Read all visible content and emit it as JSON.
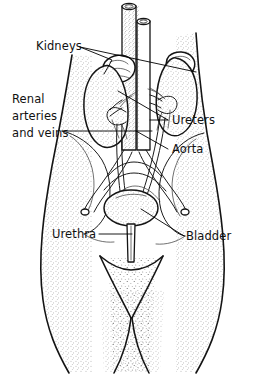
{
  "diagram": {
    "view": "posterior trunk and pelvis",
    "background_color": "#ffffff",
    "ink_color": "#141414",
    "style": "black and white stippled line drawing",
    "width": 264,
    "height": 385,
    "labels": [
      {
        "id": "kidneys",
        "text": "Kidneys",
        "x": 36,
        "y": 50,
        "anchor": "start",
        "side": "left",
        "leaders": [
          "M 93 46 L 112 60 L 104 74",
          "M 93 46 L 196 72"
        ]
      },
      {
        "id": "renal-arteries-and-veins",
        "text": "Renal\narteries\nand veins",
        "line1": "Renal",
        "line2": "arteries",
        "line3": "and veins",
        "x": 12,
        "y": 103,
        "anchor": "start",
        "side": "left",
        "leaders": [
          "M 62 131 L 152 131"
        ]
      },
      {
        "id": "ureters",
        "text": "Ureters",
        "x": 172,
        "y": 124,
        "anchor": "start",
        "side": "right",
        "leaders": [
          "M 170 120 L 118 91",
          "M 170 120 L 146 120"
        ]
      },
      {
        "id": "aorta",
        "text": "Aorta",
        "x": 172,
        "y": 153,
        "anchor": "start",
        "side": "right",
        "leaders": [
          "M 170 149 L 136 131"
        ]
      },
      {
        "id": "urethra",
        "text": "Urethra",
        "x": 52,
        "y": 238,
        "anchor": "start",
        "side": "left",
        "leaders": [
          "M 99 234 L 134 234"
        ]
      },
      {
        "id": "bladder",
        "text": "Bladder",
        "x": 186,
        "y": 240,
        "anchor": "start",
        "side": "right",
        "leaders": [
          "M 184 236 L 143 209"
        ]
      }
    ],
    "structures": [
      {
        "id": "torso-outline",
        "name": "body outline"
      },
      {
        "id": "left-kidney",
        "name": "kidney (viewer left)"
      },
      {
        "id": "right-kidney",
        "name": "kidney (viewer right)"
      },
      {
        "id": "left-adrenal",
        "name": "adrenal gland (viewer left)"
      },
      {
        "id": "right-adrenal",
        "name": "adrenal gland (viewer right)"
      },
      {
        "id": "aorta-vessel",
        "name": "aorta"
      },
      {
        "id": "vena-cava-vessel",
        "name": "inferior vena cava"
      },
      {
        "id": "left-ureter",
        "name": "ureter (viewer left)"
      },
      {
        "id": "right-ureter",
        "name": "ureter (viewer right)"
      },
      {
        "id": "bladder-organ",
        "name": "urinary bladder"
      },
      {
        "id": "urethra-tube",
        "name": "urethra"
      },
      {
        "id": "pelvis-left",
        "name": "pelvic bone (viewer left)"
      },
      {
        "id": "pelvis-right",
        "name": "pelvic bone (viewer right)"
      },
      {
        "id": "iliac-vessels",
        "name": "common iliac arteries and veins"
      }
    ]
  }
}
